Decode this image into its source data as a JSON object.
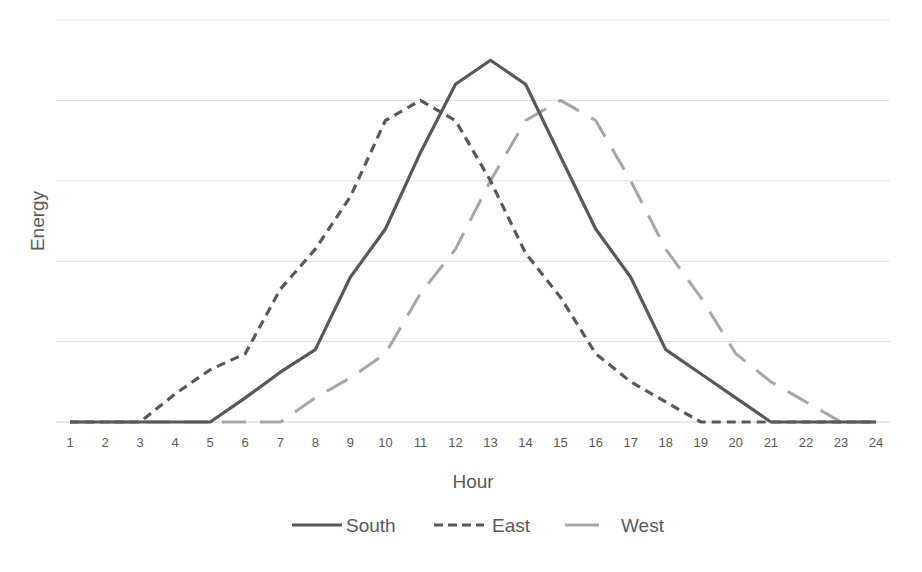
{
  "chart_data": {
    "type": "line",
    "title": "",
    "xlabel": "Hour",
    "ylabel": "Energy",
    "x": [
      1,
      2,
      3,
      4,
      5,
      6,
      7,
      8,
      9,
      10,
      11,
      12,
      13,
      14,
      15,
      16,
      17,
      18,
      19,
      20,
      21,
      22,
      23,
      24
    ],
    "ylim": [
      0,
      5
    ],
    "y_ticks_labeled": false,
    "grid": true,
    "legend_position": "bottom",
    "series": [
      {
        "name": "South",
        "style": "solid",
        "color": "#595959",
        "values": [
          0,
          0,
          0,
          0,
          0,
          0.3,
          0.62,
          0.9,
          1.8,
          2.4,
          3.35,
          4.2,
          4.5,
          4.2,
          3.3,
          2.4,
          1.8,
          0.9,
          0.6,
          0.3,
          0,
          0,
          0,
          0
        ]
      },
      {
        "name": "East",
        "style": "dashed",
        "color": "#595959",
        "values": [
          0,
          0,
          0,
          0.35,
          0.65,
          0.85,
          1.65,
          2.15,
          2.8,
          3.75,
          4.0,
          3.75,
          3.0,
          2.1,
          1.55,
          0.85,
          0.5,
          0.25,
          0,
          0,
          0,
          0,
          0,
          0
        ]
      },
      {
        "name": "West",
        "style": "long-dashed",
        "color": "#a6a6a6",
        "values": [
          0,
          0,
          0,
          0,
          0,
          0,
          0,
          0.3,
          0.55,
          0.85,
          1.6,
          2.15,
          3.0,
          3.75,
          4.0,
          3.75,
          3.0,
          2.15,
          1.55,
          0.85,
          0.5,
          0.25,
          0,
          0
        ]
      }
    ]
  }
}
